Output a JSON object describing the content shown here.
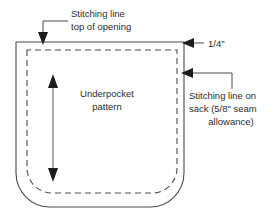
{
  "diagram": {
    "colors": {
      "line": "#4a4a4a",
      "arrow": "#1c1c1c",
      "text": "#2b2b2b",
      "background": "#ffffff"
    },
    "labels": {
      "top_callout_line1": "Stitching line",
      "top_callout_line2": "top of opening",
      "quarter_inch": "1/4\"",
      "center_line1": "Underpocket",
      "center_line2": "pattern",
      "right_callout_line1": "Stitching line on",
      "right_callout_line2": "sack (5/8\" seam",
      "right_callout_line3": "allowance)"
    },
    "shapes": {
      "outer_outline_name": "sack-cut-edge",
      "inner_outline_name": "stitching-line",
      "inner_outline_style": "dashed",
      "corner_style": "rounded-bottom"
    },
    "annotations": {
      "grain_arrow_name": "grain-direction-arrow",
      "grain_arrow_type": "double-headed-vertical"
    }
  }
}
